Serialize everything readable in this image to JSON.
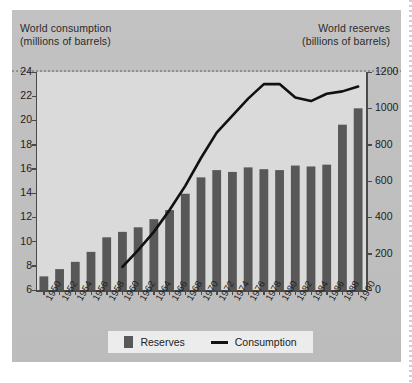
{
  "headers": {
    "left_line1": "World consumption",
    "left_line2": "(millions of barrels)",
    "right_line1": "World reserves",
    "right_line2": "(billions of barrels)"
  },
  "legend": {
    "reserves_label": "Reserves",
    "consumption_label": "Consumption"
  },
  "colors": {
    "bar": "#585858",
    "line": "#111111",
    "panel": "#bdbdbd",
    "plot": "#dadada",
    "legend_bg": "#ececec"
  },
  "caption": "",
  "chart_data": {
    "type": "bar",
    "title": "",
    "subtitle": "",
    "xlabel": "",
    "ylabel": "World consumption (millions of barrels)",
    "y2label": "World reserves (billions of barrels)",
    "grid": false,
    "legend_position": "bottom",
    "categories": [
      "1950",
      "1952",
      "1954",
      "1956",
      "1958",
      "1960",
      "1962",
      "1964",
      "1966",
      "1968",
      "1970",
      "1972",
      "1974",
      "1976",
      "1978",
      "1980",
      "1982",
      "1984",
      "1986",
      "1988",
      "1990"
    ],
    "xtick_labels": [
      "1950",
      "1952",
      "1954",
      "1956",
      "1958",
      "1960",
      "1962",
      "1964",
      "1966",
      "1968",
      "1970",
      "1972",
      "1974",
      "1976",
      "1978",
      "1980",
      "1982",
      "1984",
      "1986",
      "1988",
      "1990"
    ],
    "ylim": [
      6,
      24
    ],
    "ytick_labels": [
      "6",
      "8",
      "10",
      "12",
      "14",
      "16",
      "18",
      "20",
      "22",
      "24"
    ],
    "yticks": [
      6,
      8,
      10,
      12,
      14,
      16,
      18,
      20,
      22,
      24
    ],
    "y2lim": [
      0,
      1200
    ],
    "y2tick_labels": [
      "0",
      "200",
      "400",
      "600",
      "800",
      "1000",
      "1200"
    ],
    "y2ticks": [
      0,
      200,
      400,
      600,
      800,
      1000,
      1200
    ],
    "series": [
      {
        "name": "Reserves",
        "type": "bar",
        "axis": "right",
        "units": "billions of barrels",
        "color": "#585858",
        "values": [
          75,
          115,
          155,
          210,
          290,
          320,
          345,
          390,
          440,
          530,
          620,
          660,
          650,
          675,
          665,
          660,
          685,
          680,
          690,
          910,
          1000
        ]
      },
      {
        "name": "Consumption",
        "type": "line",
        "axis": "left",
        "units": "millions of barrels",
        "color": "#111111",
        "x": [
          "1960",
          "1962",
          "1964",
          "1966",
          "1968",
          "1970",
          "1972",
          "1974",
          "1976",
          "1978",
          "1980",
          "1982",
          "1984",
          "1986",
          "1988",
          "1990"
        ],
        "values": [
          7.9,
          9.3,
          10.8,
          12.6,
          14.6,
          16.9,
          19.0,
          20.4,
          21.8,
          23.0,
          23.0,
          21.9,
          21.6,
          22.2,
          22.4,
          22.8
        ]
      }
    ]
  }
}
